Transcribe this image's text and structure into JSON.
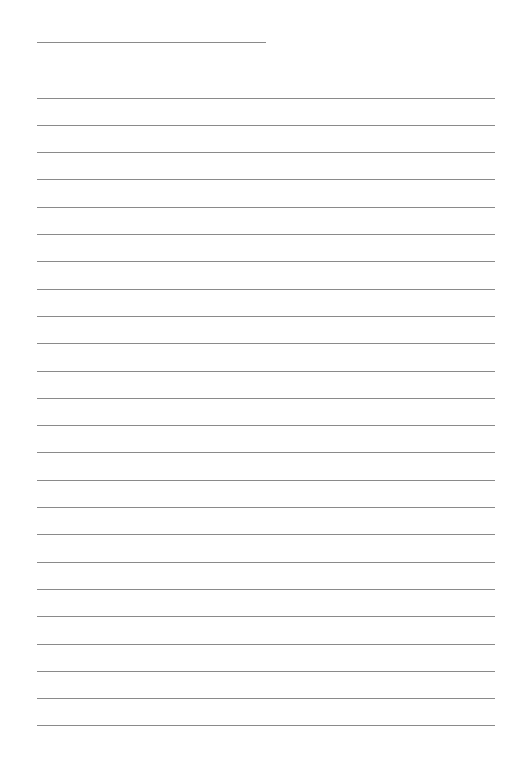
{
  "sheet": {
    "type": "lined-paper",
    "title_line": {
      "x": 37,
      "y": 42,
      "width": 229
    },
    "rules": {
      "count": 24,
      "x": 37,
      "width": 458,
      "first_y": 97.5,
      "spacing": 27.3
    },
    "line_color": "#8a8a8a",
    "background": "#ffffff"
  }
}
